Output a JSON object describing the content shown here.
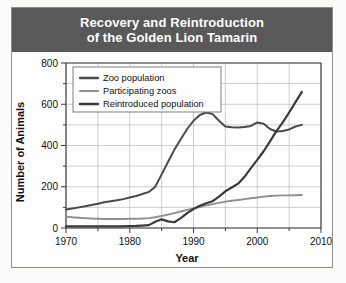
{
  "header": {
    "title_line1": "Recovery and Reintroduction",
    "title_line2": "of the Golden Lion Tamarin",
    "bar_color": "#595959"
  },
  "chart_data": {
    "type": "line",
    "title": "Recovery and Reintroduction of the Golden Lion Tamarin",
    "xlabel": "Year",
    "ylabel": "Number of Animals",
    "xlim": [
      1970,
      2010
    ],
    "ylim": [
      0,
      800
    ],
    "xticks": [
      1970,
      1980,
      1990,
      2000,
      2010
    ],
    "xticklabels": [
      "1970",
      "1980",
      "1990",
      "2000",
      "2010"
    ],
    "xminor_step": 5,
    "yticks": [
      0,
      200,
      400,
      600,
      800
    ],
    "yticklabels": [
      "0",
      "200",
      "400",
      "600",
      "800"
    ],
    "yminor_step": 100,
    "grid": true,
    "legend_position": "upper-left",
    "series": [
      {
        "name": "Zoo population",
        "color": "#4a4a4a",
        "width": 2.0,
        "x": [
          1970,
          1971,
          1972,
          1973,
          1974,
          1975,
          1976,
          1977,
          1978,
          1979,
          1980,
          1981,
          1982,
          1983,
          1984,
          1985,
          1986,
          1987,
          1988,
          1989,
          1990,
          1991,
          1992,
          1993,
          1994,
          1995,
          1996,
          1997,
          1998,
          1999,
          2000,
          2001,
          2002,
          2003,
          2004,
          2005,
          2006,
          2007
        ],
        "values": [
          90,
          95,
          100,
          105,
          112,
          118,
          125,
          130,
          135,
          140,
          148,
          155,
          165,
          175,
          200,
          260,
          320,
          380,
          430,
          480,
          520,
          548,
          560,
          552,
          520,
          492,
          488,
          487,
          490,
          495,
          512,
          505,
          480,
          468,
          470,
          478,
          492,
          500
        ]
      },
      {
        "name": "Participating zoos",
        "color": "#8f8f8f",
        "width": 1.9,
        "x": [
          1970,
          1971,
          1972,
          1973,
          1974,
          1975,
          1976,
          1977,
          1978,
          1979,
          1980,
          1981,
          1982,
          1983,
          1984,
          1985,
          1986,
          1987,
          1988,
          1989,
          1990,
          1991,
          1992,
          1993,
          1994,
          1995,
          1996,
          1997,
          1998,
          1999,
          2000,
          2001,
          2002,
          2003,
          2004,
          2005,
          2006,
          2007
        ],
        "values": [
          55,
          52,
          50,
          48,
          46,
          45,
          44,
          44,
          44,
          44,
          45,
          45,
          46,
          48,
          52,
          58,
          65,
          72,
          80,
          88,
          95,
          102,
          110,
          116,
          122,
          128,
          132,
          136,
          140,
          144,
          148,
          152,
          155,
          157,
          158,
          158,
          159,
          160
        ]
      },
      {
        "name": "Reintroduced population",
        "color": "#3a3a3a",
        "width": 2.2,
        "x": [
          1970,
          1972,
          1974,
          1976,
          1978,
          1980,
          1981,
          1982,
          1983,
          1984,
          1985,
          1986,
          1987,
          1988,
          1989,
          1990,
          1991,
          1992,
          1993,
          1994,
          1995,
          1996,
          1997,
          1998,
          1999,
          2000,
          2001,
          2002,
          2003,
          2004,
          2005,
          2006,
          2007
        ],
        "values": [
          8,
          8,
          8,
          8,
          8,
          9,
          10,
          12,
          14,
          30,
          42,
          32,
          28,
          48,
          72,
          92,
          108,
          120,
          130,
          152,
          178,
          196,
          215,
          248,
          290,
          330,
          372,
          420,
          470,
          512,
          560,
          610,
          660
        ]
      }
    ]
  }
}
